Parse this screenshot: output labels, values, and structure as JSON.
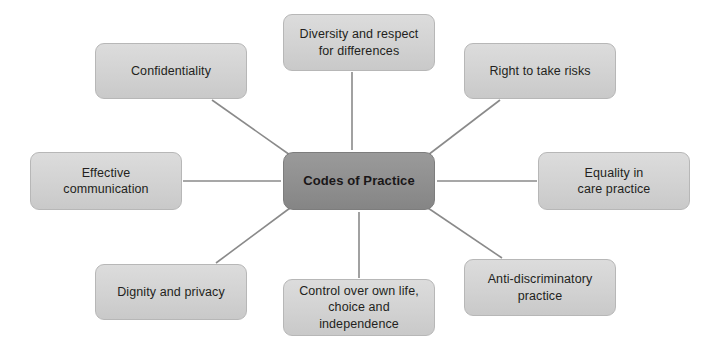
{
  "diagram": {
    "type": "hub-and-spoke",
    "title": "Codes of Practice",
    "background_color": "#ffffff",
    "center_node": {
      "id": "codes-of-practice",
      "label": "Codes of Practice",
      "fill_color": "#8f8f8f",
      "border_color": "#7d7d7d",
      "text_color": "#1a1718",
      "bold": true,
      "x": 283,
      "y": 152,
      "width": 152,
      "height": 58
    },
    "node_style": {
      "fill_color": "#d2d2d2",
      "border_color": "#b7b7b7",
      "text_color": "#231f20"
    },
    "connector_style": {
      "color": "#8a8a8a",
      "width": 1.6
    },
    "nodes": [
      {
        "id": "confidentiality",
        "label": "Confidentiality",
        "lines": [
          "Confidentiality"
        ],
        "position": "top-left",
        "x": 95,
        "y": 43,
        "width": 152,
        "height": 56
      },
      {
        "id": "diversity-and-respect-for-differences",
        "label": "Diversity and respect for differences",
        "lines": [
          "Diversity and respect",
          "for differences"
        ],
        "position": "top-center",
        "x": 283,
        "y": 14,
        "width": 152,
        "height": 57
      },
      {
        "id": "right-to-take-risks",
        "label": "Right to take risks",
        "lines": [
          "Right to take risks"
        ],
        "position": "top-right",
        "x": 464,
        "y": 43,
        "width": 152,
        "height": 56
      },
      {
        "id": "effective-communication",
        "label": "Effective communication",
        "lines": [
          "Effective",
          "communication"
        ],
        "position": "middle-left",
        "x": 30,
        "y": 152,
        "width": 152,
        "height": 58
      },
      {
        "id": "equality-in-care-practice",
        "label": "Equality in care practice",
        "lines": [
          "Equality in",
          "care practice"
        ],
        "position": "middle-right",
        "x": 538,
        "y": 152,
        "width": 152,
        "height": 58
      },
      {
        "id": "dignity-and-privacy",
        "label": "Dignity and privacy",
        "lines": [
          "Dignity and privacy"
        ],
        "position": "bottom-left",
        "x": 95,
        "y": 264,
        "width": 152,
        "height": 56
      },
      {
        "id": "control-over-own-life-choice-and-independence",
        "label": "Control over own life, choice and independence",
        "lines": [
          "Control over own life,",
          "choice and",
          "independence"
        ],
        "position": "bottom-center",
        "x": 283,
        "y": 279,
        "width": 152,
        "height": 57
      },
      {
        "id": "anti-discriminatory-practice",
        "label": "Anti-discriminatory practice",
        "lines": [
          "Anti-discriminatory",
          "practice"
        ],
        "position": "bottom-right",
        "x": 464,
        "y": 259,
        "width": 152,
        "height": 57
      }
    ],
    "connections": [
      {
        "from": "codes-of-practice",
        "to": "confidentiality"
      },
      {
        "from": "codes-of-practice",
        "to": "diversity-and-respect-for-differences"
      },
      {
        "from": "codes-of-practice",
        "to": "right-to-take-risks"
      },
      {
        "from": "codes-of-practice",
        "to": "effective-communication"
      },
      {
        "from": "codes-of-practice",
        "to": "equality-in-care-practice"
      },
      {
        "from": "codes-of-practice",
        "to": "dignity-and-privacy"
      },
      {
        "from": "codes-of-practice",
        "to": "control-over-own-life-choice-and-independence"
      },
      {
        "from": "codes-of-practice",
        "to": "anti-discriminatory-practice"
      }
    ],
    "edge_paths": [
      {
        "id": "edge-confidentiality",
        "x1": 290,
        "y1": 155,
        "x2": 212,
        "y2": 100
      },
      {
        "id": "edge-diversity",
        "x1": 352,
        "y1": 150,
        "x2": 352,
        "y2": 72
      },
      {
        "id": "edge-right-to-take-risks",
        "x1": 428,
        "y1": 155,
        "x2": 500,
        "y2": 100
      },
      {
        "id": "edge-effective-communication",
        "x1": 281,
        "y1": 181,
        "x2": 183,
        "y2": 181
      },
      {
        "id": "edge-equality",
        "x1": 437,
        "y1": 181,
        "x2": 537,
        "y2": 181
      },
      {
        "id": "edge-dignity",
        "x1": 290,
        "y1": 208,
        "x2": 216,
        "y2": 263
      },
      {
        "id": "edge-control",
        "x1": 359,
        "y1": 212,
        "x2": 359,
        "y2": 278
      },
      {
        "id": "edge-anti-discriminatory",
        "x1": 428,
        "y1": 208,
        "x2": 502,
        "y2": 258
      }
    ]
  }
}
